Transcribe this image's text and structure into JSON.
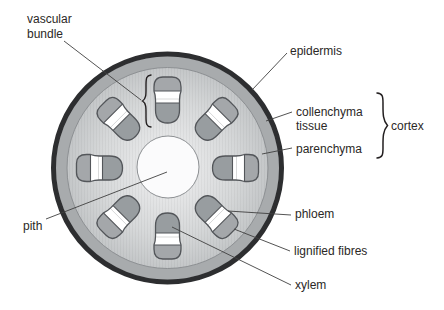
{
  "figure": {
    "type": "plant-stem-transverse-section",
    "vascular_bundle_count": 8
  },
  "labels": {
    "vascular_bundle": {
      "line1": "vascular",
      "line2": "bundle"
    },
    "epidermis": "epidermis",
    "collenchyma": {
      "line1": "collenchyma",
      "line2": "tissue"
    },
    "parenchyma": "parenchyma",
    "cortex": "cortex",
    "pith": "pith",
    "phloem": "phloem",
    "lignified_fibres": "lignified fibres",
    "xylem": "xylem"
  },
  "colors": {
    "epidermis": "#2d2e30",
    "collenchyma": "#a8abad",
    "ring_line": "#8d9093",
    "ground_outer": "#b7babc",
    "ground_mid": "#d6d8d9",
    "ground_inner": "#f0f0f1",
    "pith_fill": "#fbfbfc",
    "bundle_xylem": "#989da0",
    "bundle_cap": "#a4a7aa",
    "bundle_outline": "#53565a",
    "phloem_band": "#ffffff",
    "leader_line": "#3f3f3f",
    "text": "#2b2826",
    "brace": "#231f20",
    "bg": "#ffffff"
  }
}
